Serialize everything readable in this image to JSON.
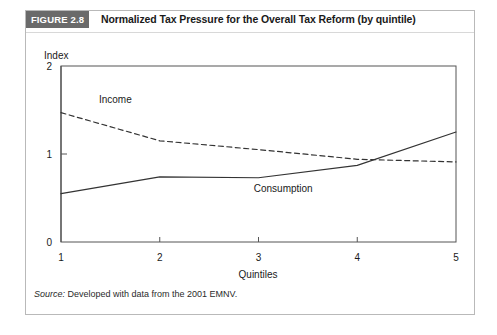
{
  "figure": {
    "badge": "FIGURE 2.8",
    "title": "Normalized Tax Pressure for the Overall Tax Reform (by quintile)",
    "source_label": "Source:",
    "source_text": " Developed with data from the 2001 EMNV."
  },
  "colors": {
    "badge_background": "#6a6a6a",
    "badge_text": "#ffffff",
    "frame_border": "#b9b9b9",
    "axis": "#555555",
    "income_line": "#333333",
    "consumption_line": "#333333",
    "text": "#1a1a1a"
  },
  "chart_data": {
    "type": "line",
    "title": "Normalized Tax Pressure for the Overall Tax Reform (by quintile)",
    "xlabel": "Quintiles",
    "ylabel": "Index",
    "x": [
      1,
      2,
      3,
      4,
      5
    ],
    "xticklabels": [
      "1",
      "2",
      "3",
      "4",
      "5"
    ],
    "yticks": [
      0,
      1,
      2
    ],
    "yticklabels": [
      "0",
      "1",
      "2"
    ],
    "xlim": [
      1,
      5
    ],
    "ylim": [
      0,
      2
    ],
    "grid": false,
    "legend_position": "inline-annotations",
    "series": [
      {
        "name": "Income",
        "label": "Income",
        "style": "dashed",
        "values": [
          1.47,
          1.15,
          1.05,
          0.94,
          0.91
        ]
      },
      {
        "name": "Consumption",
        "label": "Consumption",
        "style": "solid",
        "values": [
          0.55,
          0.74,
          0.73,
          0.87,
          1.25
        ]
      }
    ],
    "annotations": [
      {
        "text": "Income",
        "x": 1.55,
        "y": 1.58
      },
      {
        "text": "Consumption",
        "x": 3.25,
        "y": 0.57
      }
    ]
  }
}
